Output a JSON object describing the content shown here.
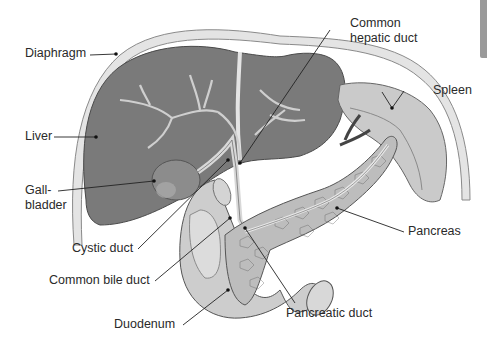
{
  "figure": {
    "colors": {
      "liver": "#7a7a7a",
      "liver_dark": "#6a6a6a",
      "diaphragm": "#e6e6e6",
      "organ_light": "#cfcfcf",
      "spleen": "#c8c8c8",
      "pancreas": "#bdbdbd",
      "line": "#222222",
      "text": "#2a2a2a"
    }
  },
  "labels": {
    "diaphragm": "Diaphragm",
    "common_hepatic_duct": "Common\nhepatic duct",
    "spleen": "Spleen",
    "liver": "Liver",
    "gallbladder": "Gall-\nbladder",
    "pancreas": "Pancreas",
    "cystic_duct": "Cystic duct",
    "common_bile_duct": "Common bile duct",
    "pancreatic_duct": "Pancreatic duct",
    "duodenum": "Duodenum"
  }
}
